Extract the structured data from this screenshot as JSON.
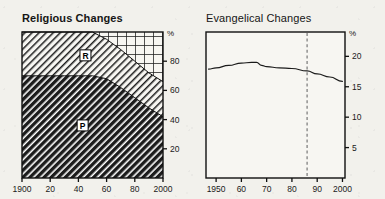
{
  "figure": {
    "background_color": "#f2f1ec",
    "ink_color": "#161616"
  },
  "charts": [
    {
      "id": "religious-changes",
      "title": "Religious Changes",
      "title_bold": true,
      "type": "area",
      "unit_label": "%",
      "xlabel": "",
      "ylabel": "",
      "xlim": [
        1900,
        2000
      ],
      "ylim": [
        0,
        100
      ],
      "xticks": [
        1900,
        1920,
        1940,
        1960,
        1980,
        2000
      ],
      "xticklabels": [
        "1900",
        "20",
        "40",
        "60",
        "80",
        "2000"
      ],
      "yticks": [
        20,
        40,
        60,
        80
      ],
      "yticklabels": [
        "20",
        "40",
        "60",
        "80"
      ],
      "grid": false,
      "legend_position": "inline-annotations",
      "annotations": [
        {
          "text": "R",
          "x": 1945,
          "y": 84,
          "meaning": "Roman Catholic band"
        },
        {
          "text": "P",
          "x": 1943,
          "y": 36,
          "meaning": "Protestant band"
        }
      ],
      "x": [
        1900,
        1910,
        1920,
        1930,
        1940,
        1950,
        1960,
        1970,
        1980,
        1990,
        2000
      ],
      "series": [
        {
          "name": "P",
          "label": "Protestant",
          "fill": "dense-diagonal-hatch",
          "stack_order": 1,
          "values": [
            70,
            70,
            70,
            70,
            70,
            70,
            68,
            62,
            55,
            48,
            42
          ]
        },
        {
          "name": "R",
          "label": "Roman Catholic",
          "fill": "light-diagonal-hatch",
          "stack_order": 2,
          "values": [
            30,
            30,
            30,
            30,
            30,
            30,
            27,
            26,
            25,
            24,
            24
          ]
        },
        {
          "name": "O",
          "label": "Other / none",
          "fill": "cross-hatch-grid",
          "stack_order": 3,
          "values": [
            0,
            0,
            0,
            0,
            0,
            0,
            5,
            12,
            20,
            28,
            34
          ]
        }
      ]
    },
    {
      "id": "evangelical-changes",
      "title": "Evangelical Changes",
      "title_bold": false,
      "type": "line",
      "unit_label": "%",
      "xlabel": "",
      "ylabel": "",
      "xlim": [
        1946,
        2001
      ],
      "ylim": [
        0,
        24
      ],
      "xticks": [
        1950,
        1960,
        1970,
        1980,
        1990,
        2000
      ],
      "xticklabels": [
        "1950",
        "60",
        "70",
        "80",
        "90",
        "2000"
      ],
      "yticks": [
        5,
        10,
        15,
        20
      ],
      "yticklabels": [
        "5",
        "10",
        "15",
        "20"
      ],
      "grid": false,
      "reference_line": {
        "type": "vertical-dashed",
        "x": 1986,
        "label": ""
      },
      "x": [
        1947,
        1950,
        1955,
        1960,
        1964,
        1966,
        1968,
        1970,
        1975,
        1980,
        1986,
        1990,
        1995,
        2000
      ],
      "series": [
        {
          "name": "evangelical-share",
          "label": "Evangelical share",
          "values": [
            17.9,
            18.1,
            18.5,
            18.9,
            19.0,
            19.0,
            18.5,
            18.3,
            18.1,
            18.0,
            17.6,
            17.1,
            16.6,
            15.9
          ]
        }
      ]
    }
  ]
}
